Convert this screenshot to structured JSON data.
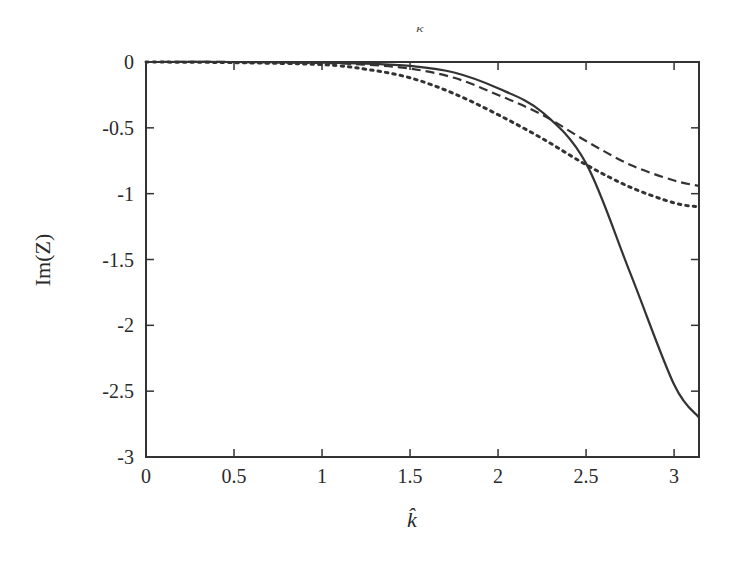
{
  "top_fragment": "κ",
  "chart_data": {
    "type": "line",
    "title": "",
    "xlabel": "k̂",
    "ylabel": "Im(Z)",
    "xlim": [
      0,
      3.14159
    ],
    "ylim": [
      -3,
      0
    ],
    "grid": false,
    "legend": null,
    "x_ticks": [
      "0",
      "0.5",
      "1",
      "1.5",
      "2",
      "2.5",
      "3"
    ],
    "y_ticks": [
      "0",
      "-0.5",
      "-1",
      "-1.5",
      "-2",
      "-2.5",
      "-3"
    ],
    "x": [
      0,
      0.5,
      1.0,
      1.25,
      1.5,
      1.75,
      2.0,
      2.25,
      2.5,
      2.75,
      3.0,
      3.14159
    ],
    "series": [
      {
        "name": "solid",
        "style": "solid",
        "values": [
          0,
          0,
          -0.005,
          -0.012,
          -0.03,
          -0.08,
          -0.2,
          -0.38,
          -0.77,
          -1.6,
          -2.45,
          -2.7
        ]
      },
      {
        "name": "dashed",
        "style": "dashed",
        "values": [
          0,
          0,
          -0.008,
          -0.02,
          -0.05,
          -0.12,
          -0.25,
          -0.4,
          -0.6,
          -0.78,
          -0.9,
          -0.94
        ]
      },
      {
        "name": "dotted",
        "style": "dotted",
        "values": [
          0,
          -0.005,
          -0.02,
          -0.055,
          -0.12,
          -0.24,
          -0.4,
          -0.58,
          -0.78,
          -0.95,
          -1.07,
          -1.1
        ]
      }
    ]
  }
}
